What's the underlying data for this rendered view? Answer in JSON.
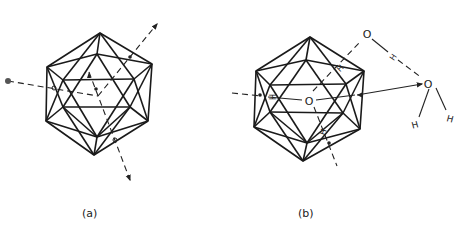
{
  "figure": {
    "panels": [
      {
        "id": "a",
        "caption": "(a)",
        "description": "Icosahedron with three dashed symmetry axes drawn through the centre, with arrowheads"
      },
      {
        "id": "b",
        "caption": "(b)",
        "description": "Icosahedral water cluster with central O, hydrogen-bonded to external water molecules",
        "atom_labels": {
          "center_oxygen": "O",
          "external_oxygen_top": "O",
          "external_oxygen_right": "O",
          "hydrogen_bridge_1": "H",
          "hydrogen_bridge_2": "H",
          "hydrogen_bridge_3": "H",
          "hydrogen_bridge_4": "H",
          "water_h_left": "H",
          "water_h_right": "H"
        }
      }
    ]
  },
  "colors": {
    "line": "#1a1a1a",
    "background": "#ffffff"
  }
}
